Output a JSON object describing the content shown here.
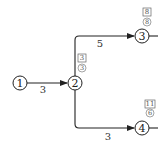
{
  "diagram": {
    "type": "activity-on-arrow network",
    "nodes": [
      {
        "id": "1",
        "label": "1",
        "earliest_box": null,
        "latest_circle": null
      },
      {
        "id": "2",
        "label": "2",
        "earliest_box": "3",
        "latest_circle": "3"
      },
      {
        "id": "3",
        "label": "3",
        "earliest_box": "8",
        "latest_circle": "8"
      },
      {
        "id": "4",
        "label": "4",
        "earliest_box": "11",
        "latest_circle": "6"
      }
    ],
    "edges": [
      {
        "from": "1",
        "to": "2",
        "label": "3"
      },
      {
        "from": "2",
        "to": "3",
        "label": "5"
      },
      {
        "from": "2",
        "to": "4",
        "label": "3"
      }
    ],
    "colors": {
      "stroke": "#222222",
      "annotation": "#555555",
      "background": "#ffffff"
    }
  }
}
